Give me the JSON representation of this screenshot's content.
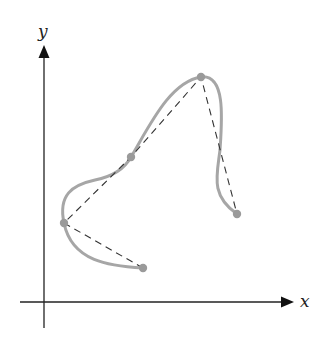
{
  "diagram": {
    "axes": {
      "x_label": "x",
      "y_label": "y",
      "origin": [
        44,
        302
      ],
      "x_axis": {
        "start": [
          20,
          302
        ],
        "end": [
          294,
          302
        ]
      },
      "y_axis": {
        "start": [
          44,
          328
        ],
        "end": [
          44,
          45
        ]
      }
    },
    "control_points": [
      {
        "id": "p0",
        "x": 143,
        "y": 268
      },
      {
        "id": "p1",
        "x": 64,
        "y": 223
      },
      {
        "id": "p2",
        "x": 131,
        "y": 157
      },
      {
        "id": "p3",
        "x": 201,
        "y": 77
      },
      {
        "id": "p4",
        "x": 237,
        "y": 214
      }
    ],
    "curve_description": "Smooth spline passing through all control points",
    "polygon_description": "Dashed line segments connecting consecutive control points",
    "colors": {
      "axis": "#222222",
      "curve": "#a6a6a6",
      "point": "#9a9a9a",
      "dashed": "#333333",
      "background": "#ffffff"
    }
  }
}
